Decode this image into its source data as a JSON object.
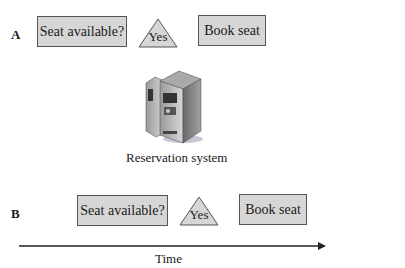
{
  "scenario_a": {
    "label": "A",
    "step1": "Seat available?",
    "decision": "Yes",
    "step2": "Book seat"
  },
  "system": {
    "icon": "server-icon",
    "caption": "Reservation system"
  },
  "scenario_b": {
    "label": "B",
    "step1": "Seat available?",
    "decision": "Yes",
    "step2": "Book seat"
  },
  "axis": {
    "label": "Time"
  },
  "colors": {
    "box_fill": "#d6d6d6",
    "box_border": "#555555",
    "triangle_fill": "#d6d6d6"
  }
}
